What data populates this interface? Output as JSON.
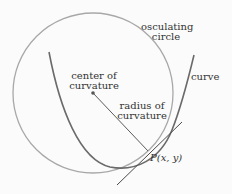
{
  "diagram": {
    "labels": {
      "osculating_circle_line1": "osculating",
      "osculating_circle_line2": "circle",
      "curve": "curve",
      "center_line1": "center of",
      "center_line2": "curvature",
      "radius_line1": "radius of",
      "radius_line2": "curvature",
      "point": "P(x, y)"
    },
    "colors": {
      "circle": "#a8a8a8",
      "curve": "#6a6a6a",
      "line": "#4a4a4a",
      "text": "#333333"
    }
  }
}
